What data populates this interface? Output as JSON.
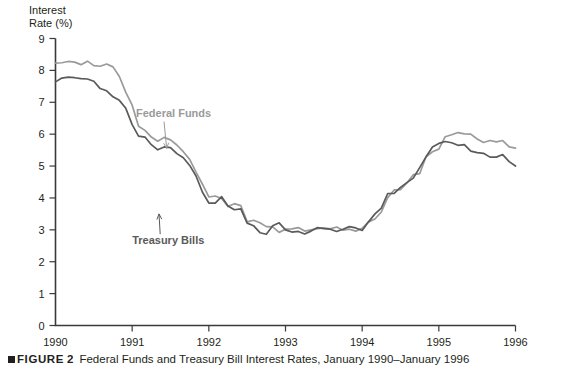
{
  "figure": {
    "marker": "square-bullet",
    "label": "FIGURE",
    "number": "2",
    "caption": "Federal Funds and Treasury Bill Interest Rates, January 1990–January 1996"
  },
  "axis_title_line1": "Interest",
  "axis_title_line2": "Rate (%)",
  "colors": {
    "federal_funds": "#9a9a9a",
    "treasury_bills": "#5a5a5a",
    "axis": "#3a3a3a",
    "text": "#231f20"
  },
  "chart_data": {
    "type": "line",
    "title": "",
    "subtitle": "",
    "xlabel": "",
    "ylabel": "Interest Rate (%)",
    "xlim": [
      1990,
      1996
    ],
    "ylim": [
      0,
      9
    ],
    "yticks": [
      0,
      1,
      2,
      3,
      4,
      5,
      6,
      7,
      8,
      9
    ],
    "ytick_labels": [
      "0",
      "1",
      "2",
      "3",
      "4",
      "5",
      "6",
      "7",
      "8",
      "9"
    ],
    "xticks": [
      1990,
      1991,
      1992,
      1993,
      1994,
      1995,
      1996
    ],
    "xtick_labels": [
      "1990",
      "1991",
      "1992",
      "1993",
      "1994",
      "1995",
      "1996"
    ],
    "grid": false,
    "legend": "in-plot annotations with leader lines",
    "annotations": [
      {
        "text": "Federal Funds",
        "x": 1991.05,
        "y": 6.55,
        "series": "Federal Funds",
        "points_to": {
          "x": 1991.45,
          "y": 5.55
        }
      },
      {
        "text": "Treasury Bills",
        "x": 1991.0,
        "y": 2.55,
        "series": "Treasury Bills",
        "points_to": {
          "x": 1991.35,
          "y": 3.5
        }
      }
    ],
    "x": [
      1990.0,
      1990.083,
      1990.167,
      1990.25,
      1990.333,
      1990.417,
      1990.5,
      1990.583,
      1990.667,
      1990.75,
      1990.833,
      1990.917,
      1991.0,
      1991.083,
      1991.167,
      1991.25,
      1991.333,
      1991.417,
      1991.5,
      1991.583,
      1991.667,
      1991.75,
      1991.833,
      1991.917,
      1992.0,
      1992.083,
      1992.167,
      1992.25,
      1992.333,
      1992.417,
      1992.5,
      1992.583,
      1992.667,
      1992.75,
      1992.833,
      1992.917,
      1993.0,
      1993.083,
      1993.167,
      1993.25,
      1993.333,
      1993.417,
      1993.5,
      1993.583,
      1993.667,
      1993.75,
      1993.833,
      1993.917,
      1994.0,
      1994.083,
      1994.167,
      1994.25,
      1994.333,
      1994.417,
      1994.5,
      1994.583,
      1994.667,
      1994.75,
      1994.833,
      1994.917,
      1995.0,
      1995.083,
      1995.167,
      1995.25,
      1995.333,
      1995.417,
      1995.5,
      1995.583,
      1995.667,
      1995.75,
      1995.833,
      1995.917,
      1996.0
    ],
    "series": [
      {
        "name": "Federal Funds",
        "color": "#9a9a9a",
        "values": [
          8.23,
          8.24,
          8.28,
          8.26,
          8.18,
          8.29,
          8.15,
          8.13,
          8.2,
          8.11,
          7.81,
          7.31,
          6.91,
          6.25,
          6.12,
          5.91,
          5.78,
          5.9,
          5.82,
          5.66,
          5.45,
          5.21,
          4.81,
          4.43,
          4.03,
          4.06,
          3.98,
          3.73,
          3.82,
          3.76,
          3.25,
          3.3,
          3.22,
          3.1,
          3.09,
          2.92,
          3.02,
          3.03,
          3.07,
          2.96,
          3.0,
          3.04,
          3.06,
          3.03,
          3.09,
          2.99,
          3.02,
          2.96,
          3.05,
          3.25,
          3.34,
          3.56,
          4.01,
          4.25,
          4.26,
          4.47,
          4.73,
          4.76,
          5.29,
          5.45,
          5.53,
          5.92,
          5.98,
          6.05,
          6.01,
          6.0,
          5.85,
          5.74,
          5.8,
          5.76,
          5.8,
          5.6,
          5.56
        ]
      },
      {
        "name": "Treasury Bills",
        "color": "#5a5a5a",
        "values": [
          7.64,
          7.76,
          7.79,
          7.77,
          7.74,
          7.73,
          7.66,
          7.43,
          7.36,
          7.17,
          7.06,
          6.81,
          6.3,
          5.94,
          5.91,
          5.67,
          5.51,
          5.6,
          5.58,
          5.39,
          5.26,
          5.02,
          4.69,
          4.18,
          3.84,
          3.84,
          4.04,
          3.75,
          3.63,
          3.66,
          3.21,
          3.13,
          2.91,
          2.86,
          3.13,
          3.22,
          3.0,
          2.93,
          2.95,
          2.87,
          2.96,
          3.07,
          3.04,
          3.02,
          2.95,
          3.02,
          3.1,
          3.06,
          2.98,
          3.25,
          3.5,
          3.68,
          4.14,
          4.14,
          4.33,
          4.48,
          4.62,
          4.95,
          5.29,
          5.6,
          5.71,
          5.77,
          5.73,
          5.65,
          5.67,
          5.47,
          5.42,
          5.4,
          5.28,
          5.28,
          5.36,
          5.14,
          5.0
        ]
      }
    ]
  }
}
